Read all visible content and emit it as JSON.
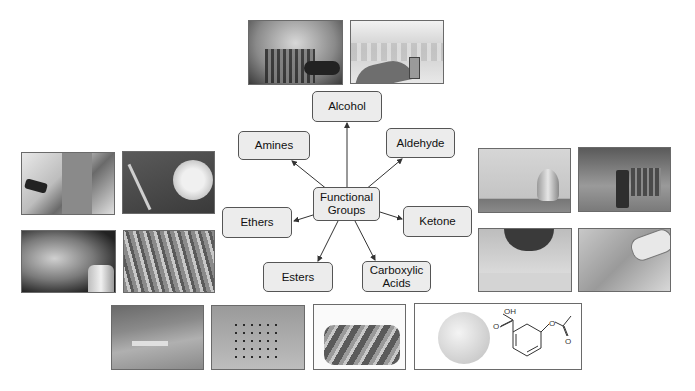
{
  "diagram": {
    "center": {
      "label": "Functional\nGroups"
    },
    "nodes": [
      {
        "id": "alcohol",
        "label": "Alcohol"
      },
      {
        "id": "amines",
        "label": "Amines"
      },
      {
        "id": "aldehyde",
        "label": "Aldehyde"
      },
      {
        "id": "ethers",
        "label": "Ethers"
      },
      {
        "id": "ketone",
        "label": "Ketone"
      },
      {
        "id": "esters",
        "label": "Esters"
      },
      {
        "id": "carboxylic",
        "label": "Carboxylic\nAcids"
      }
    ],
    "photos": {
      "alcohol": [
        "whiskey glasses and bottle",
        "hand holding small bottle"
      ],
      "amines": [
        "medical injection scene",
        "plant roots with magnifier"
      ],
      "ethers": [
        "aerosol spray can",
        "flowers field"
      ],
      "aldehyde": [
        "glass perfume bottle",
        "essential oil bottle with cinnamon"
      ],
      "ketone": [
        "woman painting nails",
        "hand with glucose meter"
      ],
      "esters": [
        "sawing wood",
        "insects on wood"
      ],
      "carboxylic": [
        "thread spools",
        "aspirin tablet with molecule"
      ]
    },
    "molecule_labels": {
      "oh": "OH",
      "o1": "O",
      "o2": "O",
      "o3": "O"
    }
  },
  "colors": {
    "node_fill": "#ececec",
    "node_border": "#555555",
    "arrow": "#333333"
  }
}
